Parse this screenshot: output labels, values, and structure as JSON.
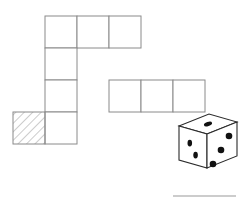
{
  "figure": {
    "background_color": "#ffffff",
    "grid_line_color": "#8a8a8a",
    "grid_line_width": 1,
    "cell_size": 32,
    "hatch_color": "#9a9a9a",
    "die_outline_color": "#2b2b2b",
    "die_face_color": "#ffffff",
    "pip_color": "#111111",
    "rule_color": "#9a9a9a"
  },
  "net": {
    "description": "Polyomino net of unit squares forming a staircase shape",
    "origin": {
      "x": 45,
      "y": 16
    },
    "cells": [
      {
        "name": "cell-r0c0",
        "col": 0,
        "row": 0,
        "hatched": false
      },
      {
        "name": "cell-r0c1",
        "col": 1,
        "row": 0,
        "hatched": false
      },
      {
        "name": "cell-r0c2",
        "col": 2,
        "row": 0,
        "hatched": false
      },
      {
        "name": "cell-r1c0",
        "col": 0,
        "row": 1,
        "hatched": false
      },
      {
        "name": "cell-r2c0",
        "col": 0,
        "row": 2,
        "hatched": false
      },
      {
        "name": "cell-r2c2",
        "col": 2,
        "row": 2,
        "hatched": false
      },
      {
        "name": "cell-r2c3",
        "col": 3,
        "row": 2,
        "hatched": false
      },
      {
        "name": "cell-r2c4",
        "col": 4,
        "row": 2,
        "hatched": false
      },
      {
        "name": "cell-r3c0",
        "col": 0,
        "row": 3,
        "hatched": false
      },
      {
        "name": "cell-r3cm1",
        "col": -1,
        "row": 3,
        "hatched": true
      }
    ],
    "hatched_cell": {
      "name": "hatched-square",
      "label": "shaded square",
      "col": -1,
      "row": 3,
      "pattern": "diagonal-hatch",
      "pattern_angle_deg": 45
    }
  },
  "die": {
    "name": "isometric-die",
    "position": {
      "x": 173,
      "y": 112
    },
    "size": 38,
    "depth": 14,
    "faces": [
      {
        "name": "die-face-top",
        "orientation": "top",
        "pips": 1,
        "pip_layout": "center"
      },
      {
        "name": "die-face-left",
        "orientation": "left",
        "pips": 2,
        "pip_layout": "diagonal"
      },
      {
        "name": "die-face-right",
        "orientation": "right",
        "pips": 3,
        "pip_layout": "diagonal"
      }
    ],
    "visible_pip_total": 6
  },
  "footer_rule": {
    "name": "bottom-rule",
    "x1": 173,
    "x2": 236,
    "y": 196
  }
}
